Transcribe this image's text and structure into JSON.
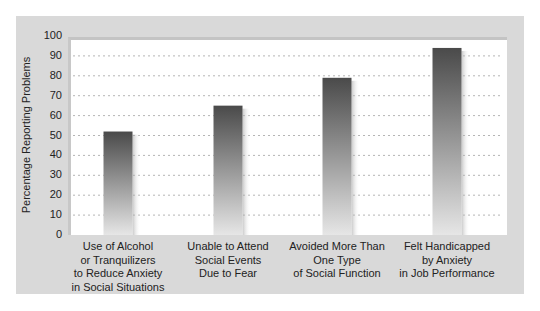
{
  "chart_data": {
    "type": "bar",
    "title": "",
    "xlabel": "",
    "ylabel": "Percentage Reporting Problems",
    "ylim": [
      0,
      100
    ],
    "yticks": [
      "0",
      "10",
      "20",
      "30",
      "40",
      "50",
      "60",
      "70",
      "80",
      "90",
      "100"
    ],
    "grid": true,
    "categories": [
      [
        "Use of Alcohol",
        "or Tranquilizers",
        "to Reduce Anxiety",
        "in Social Situations"
      ],
      [
        "Unable to Attend",
        "Social Events",
        "Due to Fear"
      ],
      [
        "Avoided More Than",
        "One Type",
        "of Social Function"
      ],
      [
        "Felt Handicapped",
        "by Anxiety",
        "in Job Performance"
      ]
    ],
    "values": [
      52,
      65,
      79,
      94
    ],
    "colors": {
      "bar_top": "#4a4a4a",
      "bar_bottom": "#e6e6e6",
      "panel": "#d9d9d9",
      "grid": "#b5b5b5"
    }
  }
}
